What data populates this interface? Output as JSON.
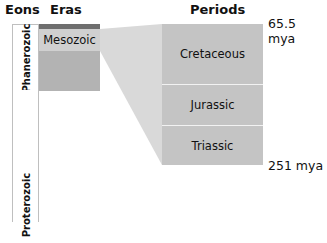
{
  "headers": {
    "eons": "Eons",
    "eras": "Eras",
    "periods": "Periods"
  },
  "eons": [
    {
      "label": "Phanerozoic"
    },
    {
      "label": "Proterozoic"
    }
  ],
  "eras": [
    {
      "label": "",
      "color": "#6e6e6e"
    },
    {
      "label": "Mesozoic",
      "color": "#d0d0d0"
    },
    {
      "label": "",
      "color": "#b3b3b3"
    }
  ],
  "periods": [
    {
      "label": "Cretaceous"
    },
    {
      "label": "Jurassic"
    },
    {
      "label": "Triassic"
    }
  ],
  "time_labels": {
    "top": "65.5 mya",
    "bottom": "251 mya"
  },
  "colors": {
    "period_fill": "#c4c4c4",
    "connector": "#d9d9d9",
    "divider": "#f2f2f2"
  }
}
